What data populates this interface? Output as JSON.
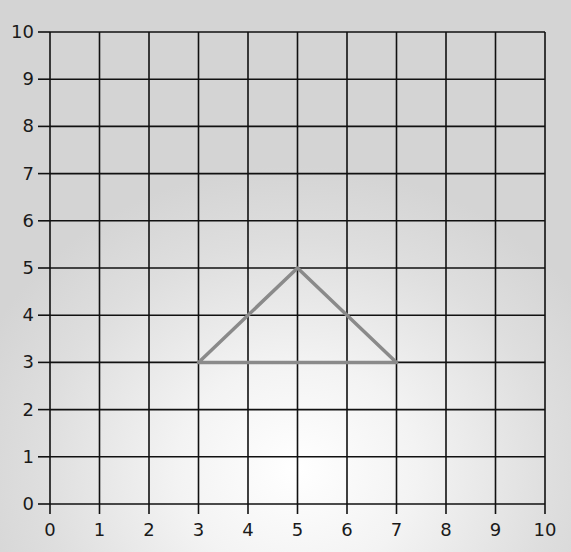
{
  "chart_data": {
    "type": "grid-diagram",
    "title": "",
    "xlabel": "",
    "ylabel": "",
    "xlim": [
      0,
      10
    ],
    "ylim": [
      0,
      10
    ],
    "grid": true,
    "x_ticks": [
      "0",
      "1",
      "2",
      "3",
      "4",
      "5",
      "6",
      "7",
      "8",
      "9",
      "10"
    ],
    "y_ticks": [
      "0",
      "1",
      "2",
      "3",
      "4",
      "5",
      "6",
      "7",
      "8",
      "9",
      "10"
    ],
    "shapes": [
      {
        "name": "triangle",
        "vertices": [
          [
            3,
            3
          ],
          [
            5,
            5
          ],
          [
            7,
            3
          ]
        ],
        "stroke": "#8a8a8a"
      }
    ]
  },
  "style": {
    "grid_color": "#111111",
    "shape_color": "#8a8a8a"
  },
  "layout": {
    "x0_px": 50,
    "x10_px": 545,
    "y0_px": 504,
    "y10_px": 32
  }
}
